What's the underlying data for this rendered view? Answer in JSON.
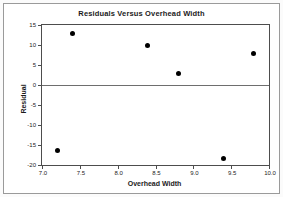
{
  "figure": {
    "background_color": "#ffffff",
    "border_color": "#9a9a9a",
    "axis_color": "#4d4d4d",
    "marker_color": "#000000",
    "reference_line_color": "#6e6e6e"
  },
  "chart_data": {
    "type": "scatter",
    "title": "Residuals Versus Overhead Width",
    "xlabel": "Overhead Width",
    "ylabel": "Residual",
    "xlim": [
      7.0,
      10.0
    ],
    "ylim": [
      -20,
      15
    ],
    "xticks": [
      7.0,
      7.5,
      8.0,
      8.5,
      9.0,
      9.5,
      10.0
    ],
    "xtick_labels": [
      "7.0",
      "7.5",
      "8.0",
      "8.5",
      "9.0",
      "9.5",
      "10.0"
    ],
    "yticks": [
      15,
      10,
      5,
      0,
      -5,
      -10,
      -15,
      -20
    ],
    "ytick_labels": [
      "15",
      "10",
      "5",
      "0",
      "-5",
      "-10",
      "-15",
      "-20"
    ],
    "grid": false,
    "legend": null,
    "reference_lines": [
      {
        "axis": "y",
        "value": 0
      }
    ],
    "points": [
      {
        "x": 7.2,
        "y": -16.3
      },
      {
        "x": 7.4,
        "y": 12.8
      },
      {
        "x": 8.4,
        "y": 10.0
      },
      {
        "x": 8.8,
        "y": 3.0
      },
      {
        "x": 9.4,
        "y": -18.3
      },
      {
        "x": 9.8,
        "y": 7.8
      }
    ]
  }
}
